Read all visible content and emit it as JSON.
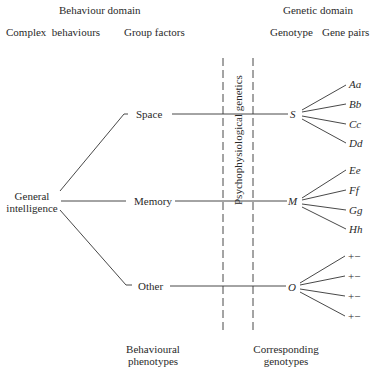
{
  "headers": {
    "behaviour_domain": "Behaviour domain",
    "genetic_domain": "Genetic domain",
    "complex_behaviours": "Complex  behaviours",
    "group_factors": "Group factors",
    "genotype": "Genotype",
    "gene_pairs": "Gene pairs"
  },
  "root": {
    "line1": "General",
    "line2": "intelligence"
  },
  "factors": [
    {
      "name": "Space",
      "genotype": "S",
      "gene_pairs": [
        "Aa",
        "Bb",
        "Cc",
        "Dd"
      ]
    },
    {
      "name": "Memory",
      "genotype": "M",
      "gene_pairs": [
        "Ee",
        "Ff",
        "Gg",
        "Hh"
      ]
    },
    {
      "name": "Other",
      "genotype": "O",
      "gene_pairs": [
        "+−",
        "+−",
        "+−",
        "+−"
      ]
    }
  ],
  "divider_label": "Psychophysiological genetics",
  "footers": {
    "left": {
      "line1": "Behavioural",
      "line2": "phenotypes"
    },
    "right": {
      "line1": "Corresponding",
      "line2": "genotypes"
    }
  }
}
